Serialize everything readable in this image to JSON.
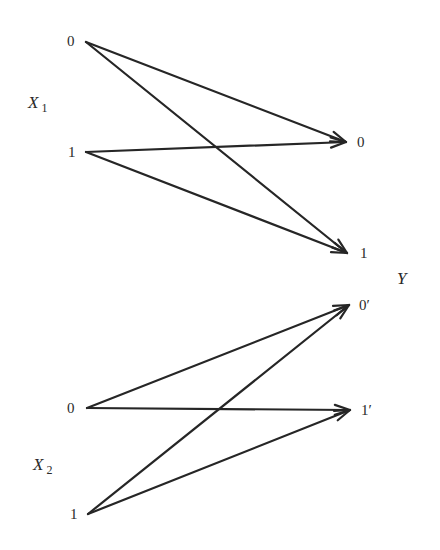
{
  "diagram": {
    "type": "channel-transition-diagram",
    "inputs": [
      {
        "name": "X",
        "subscript": "1",
        "label_pos": [
          28,
          108
        ],
        "sub_pos": [
          44,
          112
        ],
        "nodes": [
          {
            "id": "x1_0",
            "label": "0",
            "pos": [
              86,
              42
            ],
            "label_pos": [
              67,
              46
            ]
          },
          {
            "id": "x1_1",
            "label": "1",
            "pos": [
              86,
              152
            ],
            "label_pos": [
              68,
              157
            ]
          }
        ]
      },
      {
        "name": "X",
        "subscript": "2",
        "label_pos": [
          33,
          470
        ],
        "sub_pos": [
          49,
          475
        ],
        "nodes": [
          {
            "id": "x2_0",
            "label": "0",
            "pos": [
              87,
              408
            ],
            "label_pos": [
              67,
              413
            ]
          },
          {
            "id": "x2_1",
            "label": "1",
            "pos": [
              88,
              514
            ],
            "label_pos": [
              70,
              519
            ]
          }
        ]
      }
    ],
    "output": {
      "name": "Y",
      "label_pos": [
        397,
        284
      ],
      "nodes": [
        {
          "id": "y_0",
          "label": "0",
          "pos": [
            346,
            142
          ],
          "label_pos": [
            357,
            147
          ]
        },
        {
          "id": "y_1",
          "label": "1",
          "pos": [
            347,
            253
          ],
          "label_pos": [
            360,
            258
          ]
        },
        {
          "id": "y_0p",
          "label": "0′",
          "pos": [
            349,
            305
          ],
          "label_pos": [
            359,
            310
          ]
        },
        {
          "id": "y_1p",
          "label": "1′",
          "pos": [
            350,
            410
          ],
          "label_pos": [
            361,
            415
          ]
        }
      ]
    },
    "edges": [
      {
        "from": "x1_0",
        "to": "y_0"
      },
      {
        "from": "x1_0",
        "to": "y_1"
      },
      {
        "from": "x1_1",
        "to": "y_0"
      },
      {
        "from": "x1_1",
        "to": "y_1"
      },
      {
        "from": "x2_0",
        "to": "y_0p"
      },
      {
        "from": "x2_0",
        "to": "y_1p"
      },
      {
        "from": "x2_1",
        "to": "y_0p"
      },
      {
        "from": "x2_1",
        "to": "y_1p"
      }
    ],
    "colors": {
      "stroke": "#262626",
      "text": "#2a2a2a",
      "background": "#ffffff"
    }
  }
}
